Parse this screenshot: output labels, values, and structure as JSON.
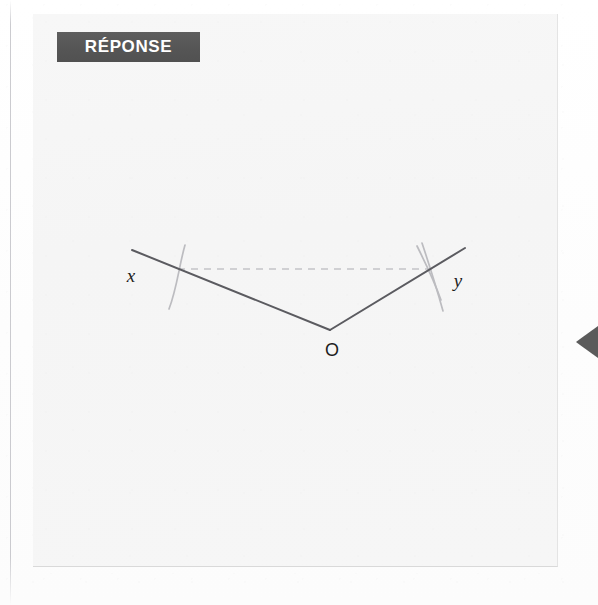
{
  "page": {
    "background_color": "#fdfdfd",
    "gutter_rule_color": "#babac0"
  },
  "panel": {
    "background_color": "#f6f6f6",
    "border_color": "#e0e0e0"
  },
  "banner": {
    "label": "RÉPONSE",
    "background_color": "#575757",
    "text_color": "#ffffff"
  },
  "figure": {
    "name": "angle-bisector-construction",
    "stroke_color_ray": "#5a5a5f",
    "stroke_color_arc": "#b9b9bd",
    "stroke_color_dashed": "#c2c2c6",
    "labels": {
      "left_ray_endpoint": "x",
      "right_ray_endpoint": "y",
      "vertex": "O"
    },
    "geometry": {
      "vertex": [
        297,
        316
      ],
      "left_endpoint": [
        99,
        236
      ],
      "right_endpoint": [
        432,
        234
      ],
      "dashed_line_start": [
        145,
        255
      ],
      "dashed_line_end": [
        399,
        255
      ]
    }
  },
  "edge_marker": {
    "name": "left-pointing-chevron",
    "color": "#5b5b5b"
  }
}
